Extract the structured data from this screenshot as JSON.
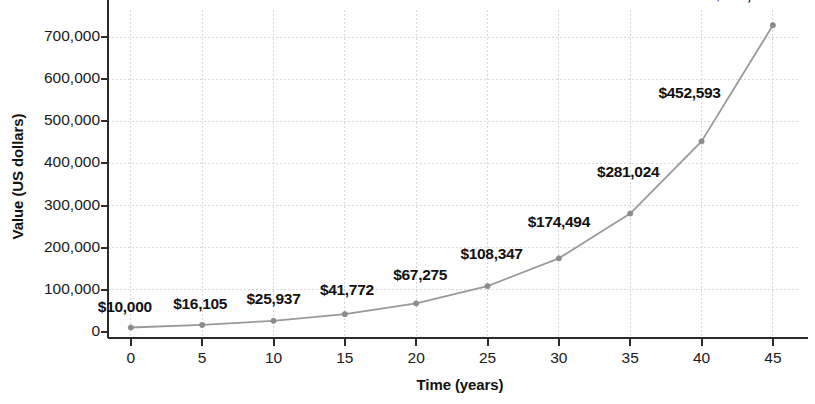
{
  "chart_data": {
    "type": "line",
    "title": "",
    "xlabel": "Time (years)",
    "ylabel": "Value (US dollars)",
    "x": [
      0,
      5,
      10,
      15,
      20,
      25,
      30,
      35,
      40,
      45
    ],
    "values": [
      10000,
      16105,
      25937,
      41772,
      67275,
      108347,
      174494,
      281024,
      452593,
      728905
    ],
    "point_labels": [
      "$10,000",
      "$16,105",
      "$25,937",
      "$41,772",
      "$67,275",
      "$108,347",
      "$174,494",
      "$281,024",
      "$452,593",
      "$728,905"
    ],
    "xticks": [
      0,
      5,
      10,
      15,
      20,
      25,
      30,
      35,
      40,
      45
    ],
    "xtick_labels": [
      "0",
      "5",
      "10",
      "15",
      "20",
      "25",
      "30",
      "35",
      "40",
      "45"
    ],
    "yticks": [
      0,
      100000,
      200000,
      300000,
      400000,
      500000,
      600000,
      700000
    ],
    "ytick_labels": [
      "0",
      "100,000",
      "200,000",
      "300,000",
      "400,000",
      "500,000",
      "600,000",
      "700,000"
    ],
    "xlim": [
      -1.6,
      46.9
    ],
    "ylim": [
      -15000,
      765000
    ],
    "grid": true,
    "legend": null,
    "series_color": "#999999",
    "marker_color": "#8c8c8c",
    "grid_color": "#d8d8d8",
    "axis_color": "#2b2b2b",
    "label_color": "#111111"
  }
}
